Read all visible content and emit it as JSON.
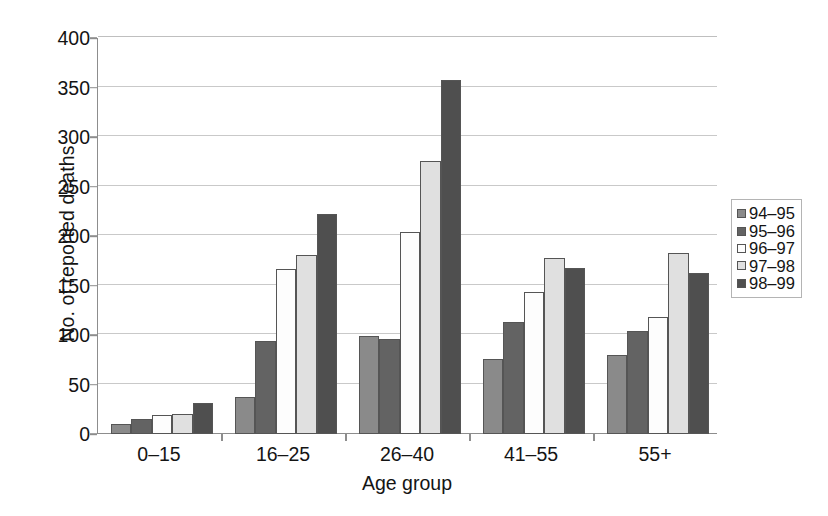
{
  "chart_data": {
    "type": "bar",
    "title": "",
    "xlabel": "Age group",
    "ylabel": "No. of reported deaths",
    "categories": [
      "0–15",
      "16–25",
      "26–40",
      "41–55",
      "55+"
    ],
    "ylim": [
      0,
      400
    ],
    "yticks": [
      0,
      50,
      100,
      150,
      200,
      250,
      300,
      350,
      400
    ],
    "ytick_labels": [
      "0",
      "50",
      "100",
      "150",
      "200",
      "250",
      "300",
      "350",
      "400"
    ],
    "grid": true,
    "legend_position": "right",
    "series": [
      {
        "name": "94–95",
        "color": "#8a8a8a",
        "values": [
          10,
          37,
          99,
          76,
          80
        ]
      },
      {
        "name": "95–96",
        "color": "#636363",
        "values": [
          15,
          94,
          96,
          113,
          104
        ]
      },
      {
        "name": "96–97",
        "color": "#fdfdfd",
        "values": [
          19,
          167,
          204,
          143,
          118
        ]
      },
      {
        "name": "97–98",
        "color": "#e0e0e0",
        "values": [
          20,
          181,
          276,
          178,
          183
        ]
      },
      {
        "name": "98–99",
        "color": "#4f4f4f",
        "values": [
          31,
          222,
          358,
          168,
          163
        ]
      }
    ]
  }
}
